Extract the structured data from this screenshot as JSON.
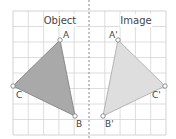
{
  "diagram": {
    "type": "reflection",
    "panels": {
      "left_title": "Object",
      "right_title": "Image"
    },
    "grid": {
      "x0": 13,
      "y0": 11,
      "x1": 166,
      "y1": 135,
      "cols": 10,
      "rows": 8,
      "line_color": "#d4d4d4",
      "border_color": "#c8c8c8"
    },
    "mirror_line": {
      "x": 89,
      "style": "dashed",
      "color": "#888888"
    },
    "object": {
      "fill": "#a9a9a9",
      "stroke": "#8a8a8a",
      "vertices": [
        {
          "label": "A",
          "x": 60,
          "y": 40,
          "lx": 63,
          "ly": 38
        },
        {
          "label": "B",
          "x": 75,
          "y": 116,
          "lx": 76,
          "ly": 127
        },
        {
          "label": "C",
          "x": 13,
          "y": 86,
          "lx": 16,
          "ly": 98
        }
      ]
    },
    "image": {
      "fill": "#dedede",
      "stroke": "#b4b4b4",
      "vertices": [
        {
          "label": "A'",
          "x": 118,
          "y": 40,
          "lx": 109,
          "ly": 38
        },
        {
          "label": "B'",
          "x": 103,
          "y": 116,
          "lx": 105,
          "ly": 127
        },
        {
          "label": "C'",
          "x": 165,
          "y": 86,
          "lx": 152,
          "ly": 98
        }
      ]
    }
  }
}
